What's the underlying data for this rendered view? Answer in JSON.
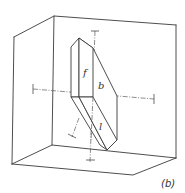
{
  "figure": {
    "caption": "(b)",
    "labels": {
      "front_face": "f",
      "back_face": "b",
      "lower_face": "l"
    }
  }
}
